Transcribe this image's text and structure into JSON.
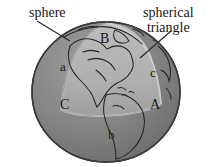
{
  "figure": {
    "kind": "spherical-geometry-diagram",
    "background_color": "#ffffff",
    "callouts": [
      {
        "name": "sphere",
        "text": "sphere"
      },
      {
        "name": "spherical-triangle",
        "line1": "spherical",
        "line2": "triangle"
      }
    ],
    "labels": {
      "side_a": "a",
      "side_b": "b",
      "side_c": "c",
      "vertex_A": "A",
      "vertex_B": "B",
      "vertex_C": "C"
    },
    "colors": {
      "sphere_shaded": "#787878",
      "sphere_highlight": "#9a9a9a",
      "triangle_fill": "#b4b4b4",
      "triangle_fill_lower": "#a2a2a2",
      "outline": "#2b2b2b",
      "coastline": "#232323",
      "leader_line": "#2a2a2a",
      "text": "#151515"
    },
    "geometry": {
      "sphere_center_x": 106,
      "sphere_center_y": 92,
      "sphere_radius_x": 74,
      "sphere_radius_y": 70
    }
  }
}
